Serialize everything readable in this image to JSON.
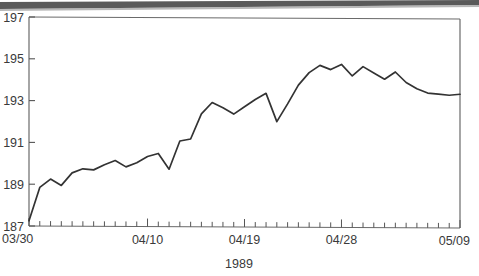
{
  "chart_data": {
    "type": "line",
    "title": "",
    "subtitle": "",
    "xlabel": "1989",
    "ylabel": "",
    "ylim": [
      187,
      197
    ],
    "xlim": [
      0,
      40
    ],
    "grid": false,
    "legend": null,
    "y_ticks": [
      187,
      189,
      191,
      193,
      195,
      197
    ],
    "y_tick_labels": [
      "187",
      "189",
      "191",
      "193",
      "195",
      "197"
    ],
    "x_tick_labels": [
      "03/30",
      "04/10",
      "04/19",
      "04/28",
      "05/09"
    ],
    "x_tick_label_positions": [
      0,
      11,
      20,
      29,
      40
    ],
    "x_minor_tick_count": 41,
    "line_color": "#333333",
    "axis_color": "#555555",
    "series": [
      {
        "name": "index",
        "x": [
          0,
          1,
          2,
          3,
          4,
          5,
          6,
          7,
          8,
          9,
          10,
          11,
          12,
          13,
          14,
          15,
          16,
          17,
          18,
          19,
          20,
          21,
          22,
          23,
          24,
          25,
          26,
          27,
          28,
          29,
          30,
          31,
          32,
          33,
          34,
          35,
          36,
          37,
          38,
          39,
          40
        ],
        "values": [
          187.25,
          188.85,
          189.25,
          188.95,
          189.55,
          189.75,
          189.7,
          189.95,
          190.15,
          189.85,
          190.05,
          190.35,
          190.5,
          189.75,
          191.1,
          191.2,
          192.4,
          192.95,
          192.7,
          192.4,
          192.75,
          193.1,
          193.4,
          192.05,
          192.9,
          193.8,
          194.4,
          194.75,
          194.55,
          194.8,
          194.25,
          194.7,
          194.4,
          194.1,
          194.45,
          193.95,
          193.65,
          193.45,
          193.4,
          193.35,
          193.4
        ]
      }
    ]
  },
  "axes": {
    "y_axis_name": "value-axis",
    "x_axis_name": "date-axis",
    "x_axis_caption": "1989"
  }
}
